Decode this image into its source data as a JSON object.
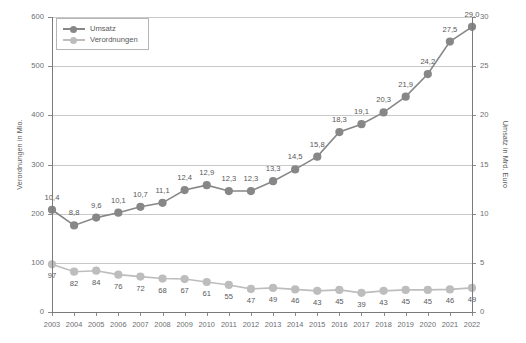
{
  "chart_data": {
    "type": "line",
    "title": "",
    "xlabel": "",
    "categories": [
      "2003",
      "2004",
      "2005",
      "2006",
      "2007",
      "2008",
      "2009",
      "2010",
      "2011",
      "2012",
      "2013",
      "2014",
      "2015",
      "2016",
      "2017",
      "2018",
      "2019",
      "2020",
      "2021",
      "2022"
    ],
    "grid": true,
    "legend_position": "top-left",
    "axes": {
      "left": {
        "label": "Verordnungen in Mio.",
        "ticks": [
          "0",
          "100",
          "200",
          "300",
          "400",
          "500",
          "600"
        ],
        "tick_values": [
          0,
          100,
          200,
          300,
          400,
          500,
          600
        ],
        "lim": [
          0,
          600
        ]
      },
      "right": {
        "label": "Umsatz in Mrd. Euro",
        "ticks": [
          "0",
          "5",
          "10",
          "15",
          "20",
          "25",
          "30"
        ],
        "tick_values": [
          0,
          5,
          10,
          15,
          20,
          25,
          30
        ],
        "lim": [
          0,
          30
        ]
      }
    },
    "series": [
      {
        "name": "Umsatz",
        "axis": "right",
        "color": "#878787",
        "values": [
          10.4,
          8.8,
          9.6,
          10.1,
          10.7,
          11.1,
          12.4,
          12.9,
          12.3,
          12.3,
          13.3,
          14.5,
          15.8,
          18.3,
          19.1,
          20.3,
          21.9,
          24.2,
          27.5,
          29.0
        ],
        "labels": [
          "10,4",
          "8,8",
          "9,6",
          "10,1",
          "10,7",
          "11,1",
          "12,4",
          "12,9",
          "12,3",
          "12,3",
          "13,3",
          "14,5",
          "15,8",
          "18,3",
          "19,1",
          "20,3",
          "21,9",
          "24,2",
          "27,5",
          "29,0"
        ]
      },
      {
        "name": "Verordnungen",
        "axis": "left",
        "color": "#bdbdbd",
        "values": [
          97,
          82,
          84,
          76,
          72,
          68,
          67,
          61,
          55,
          47,
          49,
          46,
          43,
          45,
          39,
          43,
          45,
          45,
          46,
          49
        ],
        "labels": [
          "97",
          "82",
          "84",
          "76",
          "72",
          "68",
          "67",
          "61",
          "55",
          "47",
          "49",
          "46",
          "43",
          "45",
          "39",
          "43",
          "45",
          "45",
          "46",
          "49"
        ]
      }
    ]
  },
  "legend": {
    "items": [
      {
        "label": "Umsatz"
      },
      {
        "label": "Verordnungen"
      }
    ]
  },
  "colors": {
    "umsatz": "#878787",
    "verordnungen": "#bdbdbd",
    "grid": "#c9c9c9",
    "axis": "#7a7a7a",
    "text": "#58585a"
  }
}
